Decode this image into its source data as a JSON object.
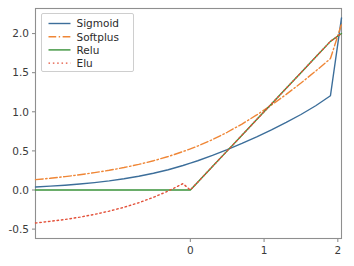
{
  "figure": {
    "background_color": "#ffffff",
    "axes_edge_color": "#8f8f8f",
    "tick_label_color": "#3b3b3b"
  },
  "chart_data": {
    "type": "line",
    "title": "",
    "xlabel": "",
    "ylabel": "",
    "xlim": [
      -2.1,
      2.05
    ],
    "ylim": [
      -0.62,
      2.32
    ],
    "xticks": [
      0,
      1,
      2
    ],
    "xtick_labels": [
      "0",
      "1",
      "2"
    ],
    "yticks": [
      -0.5,
      0.0,
      0.5,
      1.0,
      1.5,
      2.0
    ],
    "ytick_labels": [
      "-0.5",
      "0.0",
      "0.5",
      "1.0",
      "1.5",
      "2.0"
    ],
    "grid": false,
    "legend_position": "upper left",
    "x": [
      -2.1,
      -1.9,
      -1.7,
      -1.5,
      -1.3,
      -1.1,
      -0.9,
      -0.7,
      -0.5,
      -0.3,
      -0.1,
      0.0,
      0.1,
      0.3,
      0.5,
      0.7,
      0.9,
      1.1,
      1.3,
      1.5,
      1.7,
      1.9,
      2.05
    ],
    "series": [
      {
        "name": "Sigmoid",
        "color": "#3c6e9a",
        "style": "solid",
        "width": 1.4,
        "values": [
          0.039,
          0.049,
          0.061,
          0.076,
          0.094,
          0.116,
          0.143,
          0.175,
          0.214,
          0.259,
          0.313,
          0.343,
          0.374,
          0.442,
          0.516,
          0.595,
          0.679,
          0.768,
          0.863,
          0.965,
          1.077,
          1.205,
          2.2
        ]
      },
      {
        "name": "Softplus",
        "color": "#ef8636",
        "style": "dashdot",
        "width": 1.4,
        "values": [
          0.132,
          0.15,
          0.171,
          0.195,
          0.222,
          0.252,
          0.287,
          0.327,
          0.374,
          0.428,
          0.491,
          0.525,
          0.562,
          0.644,
          0.738,
          0.843,
          0.959,
          1.086,
          1.222,
          1.367,
          1.52,
          1.68,
          2.12
        ]
      },
      {
        "name": "Relu",
        "color": "#3a923a",
        "style": "solid",
        "width": 1.4,
        "values": [
          0.0,
          0.0,
          0.0,
          0.0,
          0.0,
          0.0,
          0.0,
          0.0,
          0.0,
          0.0,
          0.0,
          0.0,
          0.1,
          0.3,
          0.5,
          0.7,
          0.9,
          1.1,
          1.3,
          1.5,
          1.7,
          1.9,
          2.0
        ]
      },
      {
        "name": "Elu",
        "color": "#e3513a",
        "style": "dotted",
        "width": 1.4,
        "values": [
          -0.422,
          -0.4,
          -0.377,
          -0.347,
          -0.312,
          -0.27,
          -0.221,
          -0.163,
          -0.094,
          -0.013,
          0.081,
          0.0,
          0.1,
          0.3,
          0.5,
          0.7,
          0.9,
          1.1,
          1.3,
          1.5,
          1.7,
          1.9,
          2.0
        ]
      }
    ],
    "legend_entries": [
      "Sigmoid",
      "Softplus",
      "Relu",
      "Elu"
    ]
  }
}
